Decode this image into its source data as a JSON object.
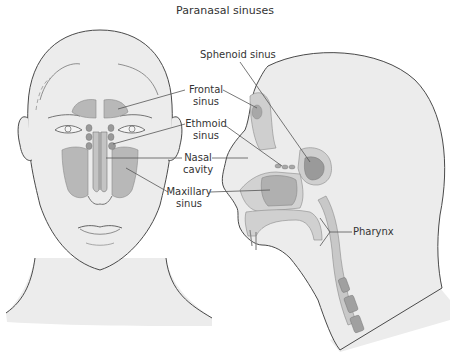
{
  "title": "Paranasal sinuses",
  "labels": {
    "sphenoid": "Sphenoid sinus",
    "frontal_1": "Frontal",
    "frontal_2": "sinus",
    "ethmoid_1": "Ethmoid",
    "ethmoid_2": "sinus",
    "nasal_1": "Nasal",
    "nasal_2": "cavity",
    "maxillary_1": "Maxillary",
    "maxillary_2": "sinus",
    "pharynx": "Pharynx"
  },
  "colors": {
    "skin": "#ececec",
    "outline": "#4a4a4a",
    "sinus": "#b8b8b8",
    "sinus_dark": "#9a9a9a",
    "leader": "#555555",
    "text": "#333333"
  },
  "figures": [
    {
      "id": "front-view",
      "description": "Frontal view of head showing sinus locations"
    },
    {
      "id": "side-view",
      "description": "Sagittal section of head showing sinuses and pharynx"
    }
  ]
}
